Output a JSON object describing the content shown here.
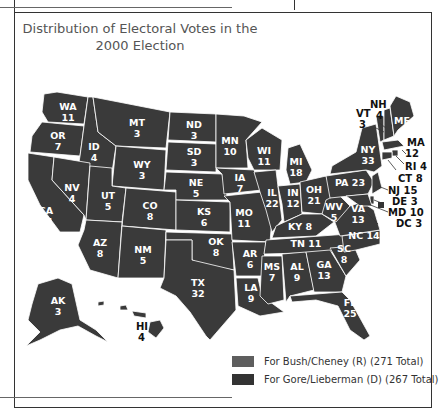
{
  "title": "Distribution of Electoral Votes in the 2000 Election",
  "title_lines": [
    "Distribution of Electoral Votes in the",
    "2000 Election"
  ],
  "colors": {
    "bush": "#5a5a5a",
    "gore": "#2e2e2e",
    "state_fill": "#3a3a3a"
  },
  "legend": [
    {
      "label": "For Bush/Cheney (R) (271 Total)",
      "party": "R",
      "total": 271,
      "color": "#5e5e5e"
    },
    {
      "label": "For Gore/Lieberman (D) (267 Total)",
      "party": "D",
      "total": 267,
      "color": "#333333"
    }
  ],
  "states": [
    {
      "abbr": "WA",
      "votes": 11
    },
    {
      "abbr": "OR",
      "votes": 7
    },
    {
      "abbr": "CA",
      "votes": 54
    },
    {
      "abbr": "ID",
      "votes": 4
    },
    {
      "abbr": "NV",
      "votes": 4
    },
    {
      "abbr": "MT",
      "votes": 3
    },
    {
      "abbr": "WY",
      "votes": 3
    },
    {
      "abbr": "UT",
      "votes": 5
    },
    {
      "abbr": "CO",
      "votes": 8
    },
    {
      "abbr": "AZ",
      "votes": 8
    },
    {
      "abbr": "NM",
      "votes": 5
    },
    {
      "abbr": "ND",
      "votes": 3
    },
    {
      "abbr": "SD",
      "votes": 3
    },
    {
      "abbr": "NE",
      "votes": 5
    },
    {
      "abbr": "KS",
      "votes": 6
    },
    {
      "abbr": "OK",
      "votes": 8
    },
    {
      "abbr": "TX",
      "votes": 32
    },
    {
      "abbr": "MN",
      "votes": 10
    },
    {
      "abbr": "IA",
      "votes": 7
    },
    {
      "abbr": "MO",
      "votes": 11
    },
    {
      "abbr": "AR",
      "votes": 6
    },
    {
      "abbr": "LA",
      "votes": 9
    },
    {
      "abbr": "WI",
      "votes": 11
    },
    {
      "abbr": "IL",
      "votes": 22
    },
    {
      "abbr": "MI",
      "votes": 18
    },
    {
      "abbr": "IN",
      "votes": 12
    },
    {
      "abbr": "OH",
      "votes": 21
    },
    {
      "abbr": "KY",
      "votes": 8
    },
    {
      "abbr": "TN",
      "votes": 11
    },
    {
      "abbr": "MS",
      "votes": 7
    },
    {
      "abbr": "AL",
      "votes": 9
    },
    {
      "abbr": "GA",
      "votes": 13
    },
    {
      "abbr": "FL",
      "votes": 25
    },
    {
      "abbr": "SC",
      "votes": 8
    },
    {
      "abbr": "NC",
      "votes": 14
    },
    {
      "abbr": "VA",
      "votes": 13
    },
    {
      "abbr": "WV",
      "votes": 5
    },
    {
      "abbr": "PA",
      "votes": 23
    },
    {
      "abbr": "NY",
      "votes": 33
    },
    {
      "abbr": "VT",
      "votes": 3
    },
    {
      "abbr": "NH",
      "votes": 4
    },
    {
      "abbr": "ME",
      "votes": 4
    },
    {
      "abbr": "MA",
      "votes": 12
    },
    {
      "abbr": "RI",
      "votes": 4
    },
    {
      "abbr": "CT",
      "votes": 8
    },
    {
      "abbr": "NJ",
      "votes": 15
    },
    {
      "abbr": "DE",
      "votes": 3
    },
    {
      "abbr": "MD",
      "votes": 10
    },
    {
      "abbr": "DC",
      "votes": 3
    },
    {
      "abbr": "AK",
      "votes": 3
    },
    {
      "abbr": "HI",
      "votes": 4
    }
  ]
}
